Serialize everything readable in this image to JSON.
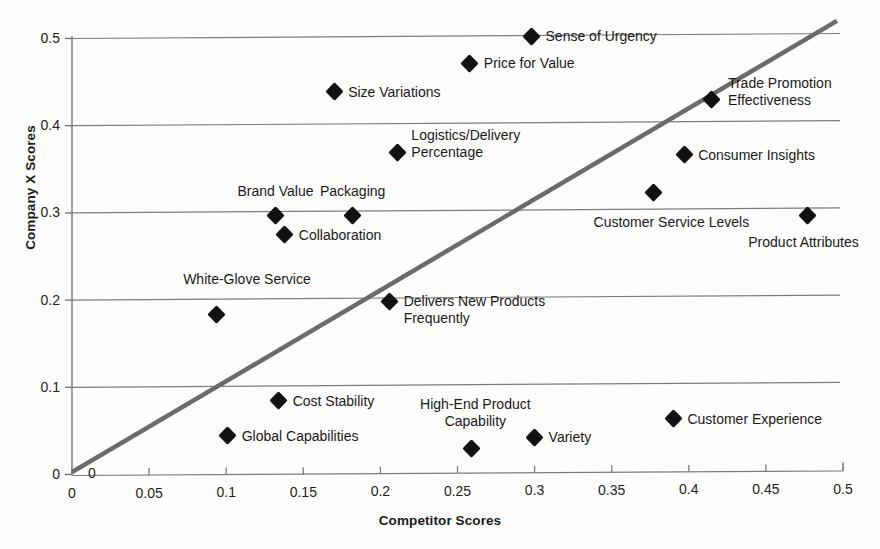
{
  "chart_data": {
    "type": "scatter",
    "title": "",
    "xlabel": "Competitor Scores",
    "ylabel": "Company X Scores",
    "xlim": [
      0,
      0.5
    ],
    "ylim": [
      0,
      0.5
    ],
    "xticks": [
      "0",
      "0.05",
      "0.1",
      "0.15",
      "0.2",
      "0.25",
      "0.3",
      "0.35",
      "0.4",
      "0.45",
      "0.5"
    ],
    "yticks": [
      "0",
      "0.1",
      "0.2",
      "0.3",
      "0.4",
      "0.5"
    ],
    "grid": "horizontal",
    "legend": "none",
    "reference_line": {
      "name": "parity-diagonal",
      "from": [
        0,
        0
      ],
      "to": [
        0.5,
        0.5
      ],
      "color": "#6b6b6b"
    },
    "points": [
      {
        "label": "Sense of Urgency",
        "x": 0.298,
        "y": 0.501,
        "label_pos": "right",
        "label_dx": 14,
        "label_dy": 0
      },
      {
        "label": "Price for Value",
        "x": 0.258,
        "y": 0.47,
        "label_pos": "right",
        "label_dx": 14,
        "label_dy": 0
      },
      {
        "label": "Size Variations",
        "x": 0.17,
        "y": 0.437,
        "label_pos": "right",
        "label_dx": 14,
        "label_dy": 0
      },
      {
        "label": "Trade Promotion\nEffectiveness",
        "x": 0.415,
        "y": 0.428,
        "label_pos": "right",
        "label_dx": 16,
        "label_dy": -8
      },
      {
        "label": "Logistics/Delivery\nPercentage",
        "x": 0.211,
        "y": 0.368,
        "label_pos": "right",
        "label_dx": 14,
        "label_dy": -8
      },
      {
        "label": "Consumer Insights",
        "x": 0.397,
        "y": 0.365,
        "label_pos": "right",
        "label_dx": 14,
        "label_dy": 0
      },
      {
        "label": "Customer Service Levels",
        "x": 0.377,
        "y": 0.322,
        "label_pos": "center",
        "label_dx": 18,
        "label_dy": 30
      },
      {
        "label": "Brand Value",
        "x": 0.132,
        "y": 0.295,
        "label_pos": "center",
        "label_dx": 0,
        "label_dy": -25
      },
      {
        "label": "Packaging",
        "x": 0.182,
        "y": 0.295,
        "label_pos": "center",
        "label_dx": 0,
        "label_dy": -25
      },
      {
        "label": "Product Attributes",
        "x": 0.477,
        "y": 0.295,
        "label_pos": "center",
        "label_dx": -4,
        "label_dy": 26
      },
      {
        "label": "Collaboration",
        "x": 0.138,
        "y": 0.273,
        "label_pos": "right",
        "label_dx": 14,
        "label_dy": 0
      },
      {
        "label": "Delivers New Products\nFrequently",
        "x": 0.206,
        "y": 0.197,
        "label_pos": "right",
        "label_dx": 14,
        "label_dy": 9
      },
      {
        "label": "White-Glove Service",
        "x": 0.094,
        "y": 0.182,
        "label_pos": "center",
        "label_dx": 30,
        "label_dy": -35
      },
      {
        "label": "Cost Stability",
        "x": 0.134,
        "y": 0.083,
        "label_pos": "right",
        "label_dx": 14,
        "label_dy": 0
      },
      {
        "label": "Customer Experience",
        "x": 0.39,
        "y": 0.062,
        "label_pos": "right",
        "label_dx": 14,
        "label_dy": 0
      },
      {
        "label": "Global Capabilities",
        "x": 0.101,
        "y": 0.043,
        "label_pos": "right",
        "label_dx": 14,
        "label_dy": 0
      },
      {
        "label": "Variety",
        "x": 0.3,
        "y": 0.041,
        "label_pos": "right",
        "label_dx": 14,
        "label_dy": 0
      },
      {
        "label": "High-End Product\nCapability",
        "x": 0.259,
        "y": 0.028,
        "label_pos": "center",
        "label_dx": 4,
        "label_dy": -36
      }
    ]
  },
  "axes": {
    "x_title": "Competitor Scores",
    "y_title": "Company X Scores"
  }
}
